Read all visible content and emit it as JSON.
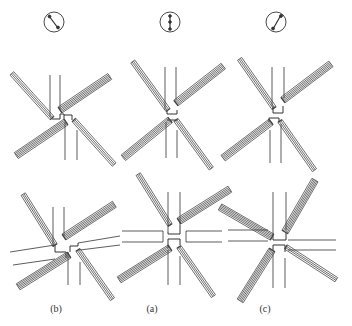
{
  "figure": {
    "columns": [
      {
        "label": "(b)",
        "indicator": "circle-with-diagonal-arrow-nw-se",
        "center_x": 54
      },
      {
        "label": "(a)",
        "indicator": "circle-with-vertical-arrow",
        "center_x": 170
      },
      {
        "label": "(c)",
        "indicator": "circle-with-diagonal-arrow-sw-ne",
        "center_x": 276
      }
    ],
    "rows": [
      "top-configuration",
      "bottom-configuration"
    ],
    "colors": {
      "line": "#333333",
      "background": "#ffffff"
    }
  }
}
